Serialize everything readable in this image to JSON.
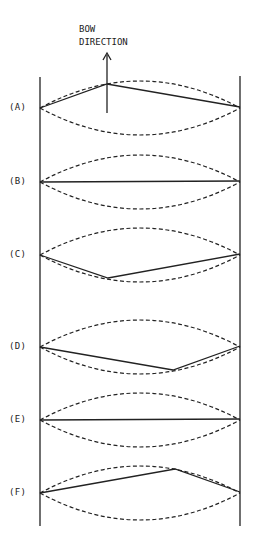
{
  "title": {
    "line1": "BOW",
    "line2": "DIRECTION"
  },
  "geometry": {
    "left_x": 40,
    "right_x": 240,
    "top_y": 76,
    "bottom_y": 526,
    "amplitude": 27
  },
  "rows": [
    {
      "label": "(A)",
      "y": 108,
      "bend": {
        "x": 107,
        "dy": -24
      }
    },
    {
      "label": "(B)",
      "y": 182,
      "bend": null
    },
    {
      "label": "(C)",
      "y": 255,
      "bend": {
        "x": 108,
        "dy": 23
      }
    },
    {
      "label": "(D)",
      "y": 347,
      "bend": {
        "x": 173,
        "dy": 23
      }
    },
    {
      "label": "(E)",
      "y": 420,
      "bend": null
    },
    {
      "label": "(F)",
      "y": 493,
      "bend": {
        "x": 175,
        "dy": -24
      }
    }
  ],
  "colors": {
    "ink": "#222222",
    "background": "#ffffff"
  }
}
